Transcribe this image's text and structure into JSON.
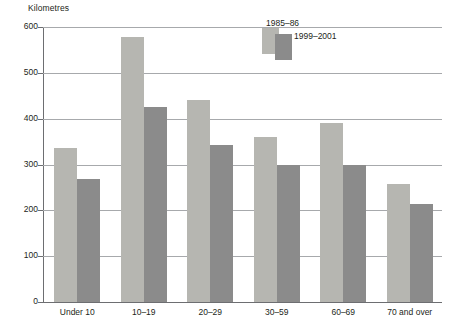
{
  "chart_data": {
    "type": "bar",
    "title": "",
    "xlabel": "",
    "ylabel": "Kilometres",
    "ylim": [
      0,
      600
    ],
    "yticks": [
      0,
      100,
      200,
      300,
      400,
      500,
      600
    ],
    "grid": true,
    "legend_position": "top-center",
    "categories": [
      "Under 10",
      "10–19",
      "20–29",
      "30–59",
      "60–69",
      "70 and over"
    ],
    "series": [
      {
        "name": "1985–86",
        "color": "#b6b6b1",
        "values": [
          335,
          578,
          440,
          360,
          390,
          257
        ]
      },
      {
        "name": "1999–2001",
        "color": "#8b8b8b",
        "values": [
          268,
          425,
          342,
          299,
          298,
          213
        ]
      }
    ]
  },
  "colors": {
    "series_1985_86": "#b6b6b1",
    "series_1999_2001": "#8b8b8b",
    "gridline": "#a7a9ac",
    "axis": "#6d6e71",
    "text": "#231f20",
    "background": "#ffffff"
  }
}
